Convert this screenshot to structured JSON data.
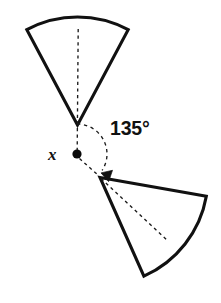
{
  "figure": {
    "background_color": "#ffffff",
    "stroke_color": "#111111",
    "canvas": {
      "width": 221,
      "height": 303
    },
    "labels": {
      "angle": "135°",
      "center_point": "x"
    },
    "center_point": {
      "name": "x",
      "x": 77,
      "y": 154,
      "radius": 4.6,
      "color": "#0a0a0a"
    },
    "shapes": [
      {
        "name": "preimage-sector",
        "role": "pre-image",
        "type": "circular-sector",
        "apex": {
          "x": 77.5,
          "y": 125
        },
        "radius": 112,
        "start_angle_deg": 242,
        "end_angle_deg": 298,
        "sweep_deg": 56,
        "fill": "#ffffff",
        "stroke": "#111111"
      },
      {
        "name": "image-sector",
        "role": "image",
        "type": "circular-sector",
        "apex": {
          "x": 100,
          "y": 177.5
        },
        "radius": 112,
        "start_angle_deg": 10,
        "end_angle_deg": 66,
        "sweep_deg": 56,
        "fill": "#ffffff",
        "stroke": "#111111"
      }
    ],
    "guides": [
      {
        "name": "preimage-bisector",
        "type": "dashed-line",
        "from": {
          "x": 78,
          "y": 29
        },
        "to": {
          "x": 77,
          "y": 154
        }
      },
      {
        "name": "image-bisector",
        "type": "dashed-line",
        "from": {
          "x": 100,
          "y": 177.5
        },
        "to": {
          "x": 168,
          "y": 241
        }
      },
      {
        "name": "angle-arc",
        "type": "dashed-arc",
        "center": {
          "x": 77,
          "y": 154
        },
        "radius": 30,
        "start_angle_deg": -90,
        "end_angle_deg": 45,
        "sweep_deg": 135
      }
    ],
    "arrow": {
      "name": "rotation-arrow",
      "tip": {
        "x": 109,
        "y": 177
      },
      "direction": "clockwise"
    }
  }
}
